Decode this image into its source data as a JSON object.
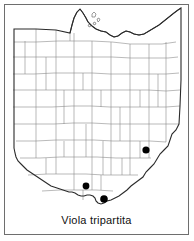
{
  "figure": {
    "kind": "species-distribution-map",
    "region": "Ohio",
    "caption": "Viola tripartita"
  },
  "colors": {
    "frame_border": "#6e6e6e",
    "state_outline": "#2b2b2b",
    "county_line": "#8c8c8c",
    "dot_fill": "#000000",
    "background": "#ffffff",
    "caption_text": "#111111"
  },
  "map": {
    "state_outline_label": "ohio-state-outline",
    "county_lines_label": "ohio-county-boundaries",
    "lake_label": "lake-erie-shoreline",
    "islands_label": "lake-erie-islands"
  },
  "occurrence_dots": [
    {
      "id": "dot-south-central",
      "x": 86,
      "y": 186,
      "r": 3.4
    },
    {
      "id": "dot-south",
      "x": 104,
      "y": 199,
      "r": 3.8
    },
    {
      "id": "dot-east",
      "x": 146,
      "y": 150,
      "r": 3.6
    }
  ]
}
